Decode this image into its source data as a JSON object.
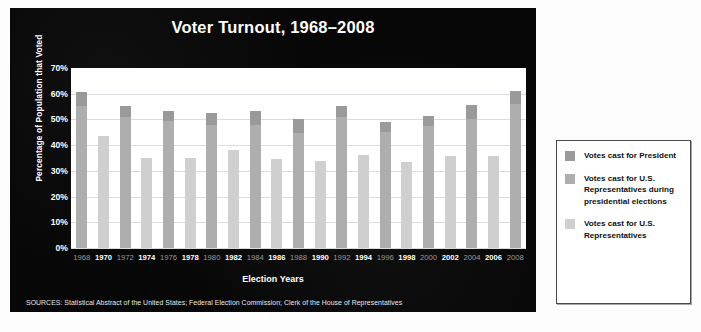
{
  "chart_data": {
    "type": "bar",
    "title": "Voter Turnout, 1968–2008",
    "xlabel": "Election Years",
    "ylabel": "Percentage of Population that Voted",
    "ylim": [
      0,
      70
    ],
    "ytick_labels": [
      "70%",
      "60%",
      "50%",
      "40%",
      "30%",
      "20%",
      "10%",
      "0%"
    ],
    "ytick_values": [
      70,
      60,
      50,
      40,
      30,
      20,
      10,
      0
    ],
    "grid": true,
    "stacked": true,
    "legend_position": "right-outside",
    "categories": [
      "1968",
      "1970",
      "1972",
      "1974",
      "1976",
      "1978",
      "1980",
      "1982",
      "1984",
      "1986",
      "1988",
      "1990",
      "1992",
      "1994",
      "1996",
      "1998",
      "2000",
      "2002",
      "2004",
      "2006",
      "2008"
    ],
    "series": [
      {
        "name": "Votes cast for President",
        "color": "#9a9a9a",
        "values": [
          60.7,
          null,
          55.1,
          null,
          53.4,
          null,
          52.6,
          null,
          53.1,
          null,
          50.1,
          null,
          55.2,
          null,
          49.0,
          null,
          51.2,
          null,
          55.6,
          null,
          61.2
        ]
      },
      {
        "name": "Votes cast for U.S. Representatives during presidential elections",
        "color": "#aeaeae",
        "values": [
          55.1,
          null,
          50.9,
          null,
          49.5,
          null,
          48.0,
          null,
          47.8,
          null,
          44.8,
          null,
          50.8,
          null,
          45.3,
          null,
          47.4,
          null,
          50.2,
          null,
          56.0
        ]
      },
      {
        "name": "Votes cast for U.S. Representatives",
        "color": "#cfcfcf",
        "values": [
          null,
          43.5,
          null,
          35.2,
          null,
          34.9,
          null,
          38.1,
          null,
          34.5,
          null,
          33.9,
          null,
          36.0,
          null,
          33.6,
          null,
          35.6,
          null,
          35.6,
          null
        ]
      }
    ],
    "year_label_styles": {
      "1968": "pres",
      "1970": "mid",
      "1972": "pres",
      "1974": "mid",
      "1976": "pres",
      "1978": "mid",
      "1980": "pres",
      "1982": "mid",
      "1984": "pres",
      "1986": "mid",
      "1988": "pres",
      "1990": "mid",
      "1992": "pres",
      "1994": "mid",
      "1996": "pres",
      "1998": "mid",
      "2000": "pres",
      "2002": "mid",
      "2004": "pres",
      "2006": "mid",
      "2008": "pres"
    },
    "sources": "SOURCES: Statistical Abstract of the United States; Federal Election Commission; Clerk of the House of Representatives"
  },
  "legend": {
    "items": [
      {
        "label": "Votes cast for President",
        "color": "#9a9a9a"
      },
      {
        "label": "Votes cast for U.S. Representatives during presidential elections",
        "color": "#aeaeae"
      },
      {
        "label": "Votes cast for U.S. Representatives",
        "color": "#cfcfcf"
      }
    ]
  },
  "colors": {
    "panel_background": "#070707",
    "plot_background": "#ffffff",
    "gridline": "#d9dde2",
    "title_text": "#ffffff",
    "presidential_year_label": "#9a9a9a",
    "midterm_year_label": "#ffffff"
  }
}
